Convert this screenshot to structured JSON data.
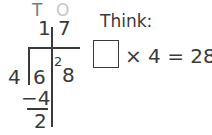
{
  "division": {
    "headers": {
      "tens": "T",
      "ones": "O"
    },
    "quotient": {
      "tens": "1",
      "ones": "7"
    },
    "divisor": "4",
    "dividend": {
      "tens": "6",
      "ones": "8",
      "carry": "2"
    },
    "subtract": "−4",
    "remainder": "2"
  },
  "think": {
    "label": "Think:",
    "equation": "× 4 = 28"
  },
  "colors": {
    "text": "#3a3a3a",
    "ones_header": "#c8c8c8"
  }
}
